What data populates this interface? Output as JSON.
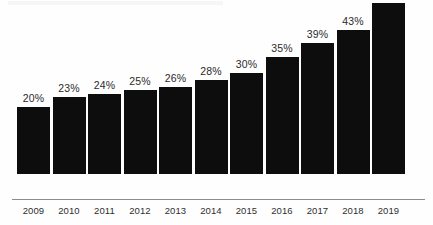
{
  "chart_data": {
    "type": "bar",
    "title": "",
    "subtitle": "",
    "xlabel": "",
    "ylabel": "",
    "ylim": [
      0,
      51
    ],
    "grid": false,
    "legend": "none",
    "orientation": "vertical",
    "bar_color": "#0d0d0d",
    "background_color": "#ffffff",
    "axis_line_color": "#8d8d8d",
    "value_label_suffix": "%",
    "categories": [
      "2009",
      "2010",
      "2011",
      "2012",
      "2013",
      "2014",
      "2015",
      "2016",
      "2017",
      "2018",
      "2019"
    ],
    "values": [
      20,
      23,
      24,
      25,
      26,
      28,
      30,
      35,
      39,
      43,
      51
    ],
    "value_labels": [
      "20%",
      "23%",
      "24%",
      "25%",
      "26%",
      "28%",
      "30%",
      "35%",
      "39%",
      "43%",
      "51%"
    ],
    "bars": [
      {
        "category": "2009",
        "value": 20,
        "label": "20%"
      },
      {
        "category": "2010",
        "value": 23,
        "label": "23%"
      },
      {
        "category": "2011",
        "value": 24,
        "label": "24%"
      },
      {
        "category": "2012",
        "value": 25,
        "label": "25%"
      },
      {
        "category": "2013",
        "value": 26,
        "label": "26%"
      },
      {
        "category": "2014",
        "value": 28,
        "label": "28%"
      },
      {
        "category": "2015",
        "value": 30,
        "label": "30%"
      },
      {
        "category": "2016",
        "value": 35,
        "label": "35%"
      },
      {
        "category": "2017",
        "value": 39,
        "label": "39%"
      },
      {
        "category": "2018",
        "value": 43,
        "label": "43%"
      },
      {
        "category": "2019",
        "value": 51,
        "label": "51%"
      }
    ]
  }
}
